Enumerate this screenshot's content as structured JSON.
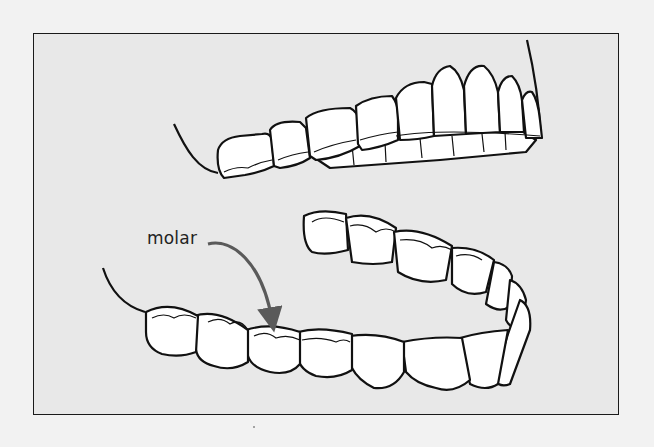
{
  "figure": {
    "background_color": "#e8e8e8",
    "frame_color": "#1a1a1a",
    "annotation": {
      "label": "molar",
      "arrow_color": "#5a5a5a"
    },
    "parts": [
      "upper-arch",
      "lower-arch"
    ]
  }
}
